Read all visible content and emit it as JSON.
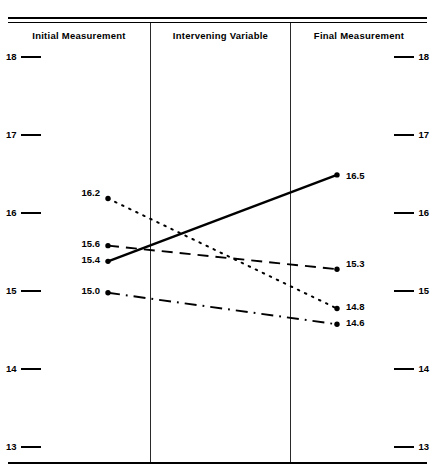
{
  "chart_data": {
    "type": "line",
    "title": "",
    "subtitle": "",
    "xlabel": "",
    "ylabel": "",
    "ylim": [
      13,
      18
    ],
    "yticks": [
      "13",
      "14",
      "15",
      "16",
      "17",
      "18"
    ],
    "grid": false,
    "legend_position": "none",
    "categories": [
      "Initial Measurement",
      "Final Measurement"
    ],
    "x_sections": [
      "Initial Measurement",
      "Intervening Variable",
      "Final Measurement"
    ],
    "series": [
      {
        "name": "solid-line",
        "style": "solid",
        "values": [
          15.4,
          16.5
        ],
        "labels": [
          "15.4",
          "16.5"
        ]
      },
      {
        "name": "dashed-line",
        "style": "dashed",
        "values": [
          15.6,
          15.3
        ],
        "labels": [
          "15.6",
          "15.3"
        ]
      },
      {
        "name": "dotted-line",
        "style": "dotted",
        "values": [
          16.2,
          14.8
        ],
        "labels": [
          "16.2",
          "14.8"
        ]
      },
      {
        "name": "dash-dot-line",
        "style": "dashdot",
        "values": [
          15.0,
          14.6
        ],
        "labels": [
          "15.0",
          "14.6"
        ]
      }
    ]
  },
  "headers": {
    "initial": "Initial Measurement",
    "intervening": "Intervening Variable",
    "final": "Final Measurement"
  },
  "axis": {
    "left": [
      "18",
      "17",
      "16",
      "15",
      "14",
      "13"
    ],
    "right": [
      "18",
      "17",
      "16",
      "15",
      "14",
      "13"
    ]
  },
  "point_labels": {
    "left": [
      "16.2",
      "15.6",
      "15.4",
      "15.0"
    ],
    "right": [
      "16.5",
      "15.3",
      "14.8",
      "14.6"
    ]
  },
  "colors": {
    "ink": "#000000",
    "background": "#ffffff",
    "divider": "#2a2a2a"
  }
}
